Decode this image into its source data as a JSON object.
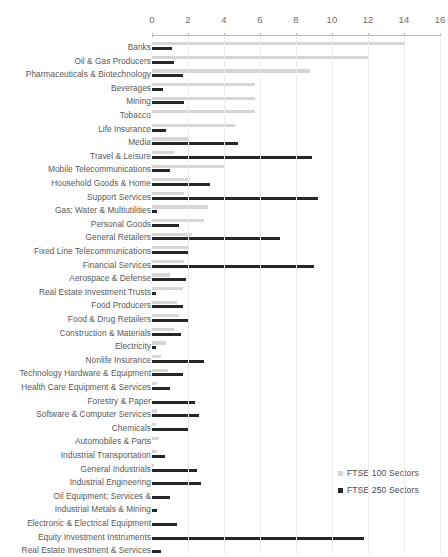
{
  "chart_data": {
    "type": "bar",
    "orientation": "horizontal",
    "title": "",
    "xlabel": "",
    "ylabel": "",
    "xlim": [
      0,
      16
    ],
    "xticks": [
      0,
      2,
      4,
      6,
      8,
      10,
      12,
      14,
      16
    ],
    "grid": true,
    "legend_position": "bottom-right",
    "colors": {
      "ftse_100": "#d6d6d6",
      "ftse_250": "#262626",
      "grid": "#ececec",
      "axis": "#b9b9b9",
      "label": "#595959"
    },
    "legend": [
      {
        "name": "FTSE 100 Sectors",
        "color": "#d6d6d6"
      },
      {
        "name": "FTSE 250 Sectors",
        "color": "#262626"
      }
    ],
    "categories": [
      "Banks",
      "Oil & Gas Producers",
      "Pharmaceuticals & Biotechnology",
      "Beverages",
      "Mining",
      "Tobacco",
      "Life Insurance",
      "Media",
      "Travel & Leisure",
      "Mobile Telecommunications",
      "Household Goods & Home",
      "Support Services",
      "Gas; Water & Multiutilities",
      "Personal Goods",
      "General Retailers",
      "Fixed Line Telecommunications",
      "Financial Services",
      "Aerospace & Defense",
      "Real Estate Investment Trusts",
      "Food Producers",
      "Food & Drug Retailers",
      "Construction & Materials",
      "Electricity",
      "Nonlife Insurance",
      "Technology Hardware & Equipment",
      "Health Care Equipment & Services",
      "Forestry & Paper",
      "Software & Computer Services",
      "Chemicals",
      "Automobiles & Parts",
      "Industrial Transportation",
      "General Industrials",
      "Industrial Engineering",
      "Oil Equipment; Services &",
      "Industrial Metals & Mining",
      "Electronic & Electrical Equipment",
      "Equity Investment Instruments",
      "Real Estate Investment & Services"
    ],
    "series": [
      {
        "name": "FTSE 100 Sectors",
        "color": "#d6d6d6",
        "values": [
          14.0,
          12.0,
          8.8,
          5.7,
          5.7,
          5.7,
          4.6,
          2.0,
          1.2,
          4.0,
          2.1,
          1.8,
          3.1,
          2.9,
          2.2,
          2.0,
          1.8,
          1.0,
          1.7,
          1.4,
          1.5,
          1.2,
          0.8,
          0.5,
          0.9,
          0.3,
          0.0,
          0.3,
          0.2,
          0.4,
          0.3,
          0.1,
          0.0,
          0.0,
          0.0,
          0.0,
          0.0,
          0.0
        ]
      },
      {
        "name": "FTSE 250 Sectors",
        "color": "#262626",
        "values": [
          1.1,
          1.2,
          1.7,
          0.6,
          1.8,
          0.0,
          0.8,
          4.8,
          8.9,
          1.0,
          3.2,
          9.2,
          0.3,
          1.5,
          7.1,
          2.0,
          9.0,
          1.9,
          0.2,
          1.7,
          2.0,
          1.6,
          0.2,
          2.9,
          1.7,
          1.0,
          2.4,
          2.6,
          2.0,
          0.0,
          0.7,
          2.5,
          2.7,
          1.0,
          0.3,
          1.4,
          11.8,
          0.5
        ]
      }
    ]
  },
  "legend": {
    "items": [
      {
        "label": "FTSE 100 Sectors"
      },
      {
        "label": "FTSE 250 Sectors"
      }
    ]
  }
}
